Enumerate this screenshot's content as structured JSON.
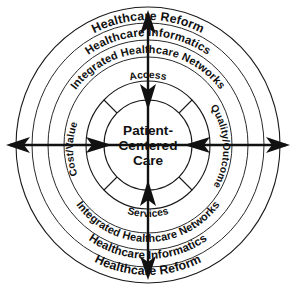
{
  "diagram": {
    "center": {
      "line1": "Patient-",
      "line2": "Centered",
      "line3": "Care"
    },
    "inner_sectors": [
      {
        "id": "access",
        "label": "Access",
        "position": "top"
      },
      {
        "id": "quality-outcomes",
        "label": "Quality/Outcomes",
        "position": "right"
      },
      {
        "id": "services",
        "label": "Services",
        "position": "bottom"
      },
      {
        "id": "cost-value",
        "label": "Cost/Value",
        "position": "left"
      }
    ],
    "rings": [
      {
        "id": "integrated-healthcare-networks",
        "label": "Integrated Healthcare Networks",
        "order": 1
      },
      {
        "id": "healthcare-informatics",
        "label": "Healthcare Informatics",
        "order": 2
      },
      {
        "id": "healthcare-reform",
        "label": "Healthcare Reform",
        "order": 3
      }
    ],
    "ring_labels_bottom": [
      {
        "id": "integrated-healthcare-networks-bottom",
        "label": "Integrated Healthcare Networks"
      },
      {
        "id": "healthcare-informatics-bottom",
        "label": "Healthcare Informatics"
      },
      {
        "id": "healthcare-reform-bottom",
        "label": "Healthcare Reform"
      }
    ],
    "axes": [
      {
        "id": "vertical-axis",
        "orientation": "vertical",
        "heads": "both"
      },
      {
        "id": "horizontal-axis",
        "orientation": "horizontal",
        "heads": "both"
      }
    ],
    "colors": {
      "stroke": "#111111",
      "background": "#ffffff"
    }
  }
}
